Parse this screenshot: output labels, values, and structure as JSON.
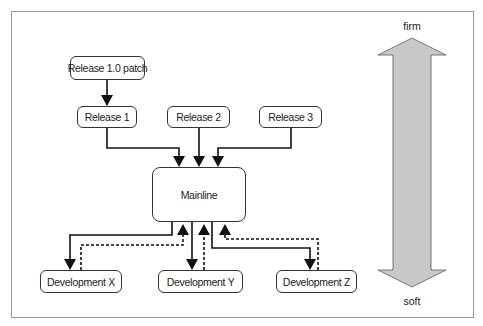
{
  "nodes": {
    "release_patch": "Release 1.0 patch",
    "release_1": "Release 1",
    "release_2": "Release 2",
    "release_3": "Release 3",
    "mainline": "Mainline",
    "dev_x": "Development X",
    "dev_y": "Development Y",
    "dev_z": "Development Z"
  },
  "scale": {
    "top_label": "firm",
    "bottom_label": "soft",
    "fill_color": "#c8c8c8"
  },
  "edges": [
    {
      "from": "Release 1.0 patch",
      "to": "Release 1",
      "style": "solid"
    },
    {
      "from": "Release 1",
      "to": "Mainline",
      "style": "solid"
    },
    {
      "from": "Release 2",
      "to": "Mainline",
      "style": "solid"
    },
    {
      "from": "Release 3",
      "to": "Mainline",
      "style": "solid"
    },
    {
      "from": "Mainline",
      "to": "Development X",
      "style": "solid"
    },
    {
      "from": "Development X",
      "to": "Mainline",
      "style": "dashed"
    },
    {
      "from": "Mainline",
      "to": "Development Y",
      "style": "solid"
    },
    {
      "from": "Development Y",
      "to": "Mainline",
      "style": "dashed"
    },
    {
      "from": "Mainline",
      "to": "Development Z",
      "style": "solid"
    },
    {
      "from": "Development Z",
      "to": "Mainline",
      "style": "dashed"
    }
  ]
}
